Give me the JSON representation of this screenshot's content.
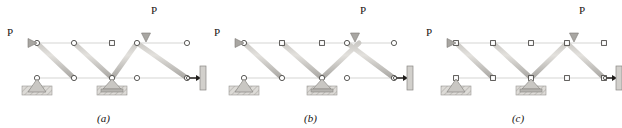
{
  "figure": {
    "background": "#ffffff",
    "width": 622,
    "height": 128
  },
  "style": {
    "member_light": "#d8d6d2",
    "member_mid": "#b3b1ad",
    "member_dark": "#8e8c88",
    "member_outline": "#6f6d69",
    "joint_fill": "#ffffff",
    "joint_stroke": "#4a4846",
    "support_fill": "#c9c7c3",
    "support_dark": "#9a9894",
    "hatch_fill": "#d6d4d0",
    "arrow_color": "#a6a4a0",
    "arrow_outline": "#7d7b77",
    "text_color": "#181512"
  },
  "panels": [
    {
      "id": "truss-a",
      "caption": "(a)",
      "x_offset": 0,
      "horizontal_load": {
        "label": "P",
        "at_joint": "top-left",
        "direction": "right"
      },
      "vertical_load": {
        "label": "P",
        "at_joint": "top-node-4",
        "direction": "down"
      },
      "supports": [
        {
          "type": "pin",
          "at_joint": "bottom-node-1"
        },
        {
          "type": "roller",
          "at_joint": "bottom-node-3"
        },
        {
          "type": "link-to-wall",
          "at_joint": "bottom-node-5"
        }
      ],
      "top_chord_gap": true,
      "bottom_chord_gap": false,
      "top_nodes": 6,
      "bottom_nodes": 5,
      "note": "Top chord discontinuous between third and fourth top joints"
    },
    {
      "id": "truss-b",
      "caption": "(b)",
      "x_offset": 207,
      "horizontal_load": {
        "label": "P",
        "at_joint": "top-left",
        "direction": "right"
      },
      "vertical_load": {
        "label": "P",
        "at_joint": "top-node-4",
        "direction": "down"
      },
      "supports": [
        {
          "type": "pin",
          "at_joint": "bottom-node-1"
        },
        {
          "type": "roller",
          "at_joint": "bottom-node-3"
        },
        {
          "type": "link-to-wall",
          "at_joint": "bottom-node-5"
        }
      ],
      "top_chord_gap": false,
      "bottom_chord_gap": true,
      "top_nodes": 5,
      "bottom_nodes": 5,
      "note": "Bottom chord discontinuous between third and fourth bottom joints"
    },
    {
      "id": "truss-c",
      "caption": "(c)",
      "x_offset": 414,
      "horizontal_load": {
        "label": "P",
        "at_joint": "top-left",
        "direction": "right"
      },
      "vertical_load": {
        "label": "P",
        "at_joint": "top-node-4",
        "direction": "down"
      },
      "supports": [
        {
          "type": "pin",
          "at_joint": "bottom-node-1"
        },
        {
          "type": "roller",
          "at_joint": "bottom-node-3"
        },
        {
          "type": "link-to-wall",
          "at_joint": "bottom-node-5"
        }
      ],
      "top_chord_gap": false,
      "bottom_chord_gap": false,
      "top_nodes": 5,
      "bottom_nodes": 5,
      "note": "Both chords continuous; four panels with alternating diagonals"
    }
  ]
}
